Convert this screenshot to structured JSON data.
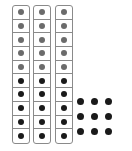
{
  "diagram": {
    "rods": [
      {
        "cells": 10,
        "gray_count": 5,
        "black_count": 5
      },
      {
        "cells": 10,
        "gray_count": 5,
        "black_count": 5
      },
      {
        "cells": 10,
        "gray_count": 5,
        "black_count": 5
      }
    ],
    "loose_dots": {
      "rows": 3,
      "cols": 3,
      "count": 9
    },
    "colors": {
      "gray_dot": "#6b6b6b",
      "black_dot": "#1a1a1a",
      "border": "#8a8a8a"
    },
    "total": 39
  }
}
